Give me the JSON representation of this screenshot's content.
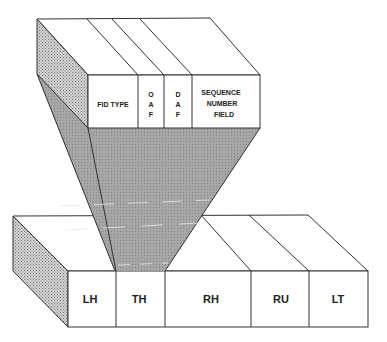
{
  "diagram": {
    "upper_block": {
      "fields": [
        {
          "id": "fid_type",
          "label": "FID TYPE"
        },
        {
          "id": "oaf",
          "label": "O A F",
          "lines": [
            "O",
            "A",
            "F"
          ]
        },
        {
          "id": "daf",
          "label": "D A F",
          "lines": [
            "D",
            "A",
            "F"
          ]
        },
        {
          "id": "sequence_number_field",
          "label": "SEQUENCE NUMBER FIELD",
          "lines": [
            "SEQUENCE",
            "NUMBER",
            "FIELD"
          ]
        }
      ]
    },
    "lower_block": {
      "fields": [
        {
          "id": "lh",
          "label": "LH"
        },
        {
          "id": "th",
          "label": "TH"
        },
        {
          "id": "rh",
          "label": "RH"
        },
        {
          "id": "ru",
          "label": "RU"
        },
        {
          "id": "lt",
          "label": "LT"
        }
      ]
    },
    "colors": {
      "stroke": "#333333",
      "face": "#ffffff",
      "shade": "#a8a8a8",
      "shade_light": "#c8c8c8"
    }
  }
}
